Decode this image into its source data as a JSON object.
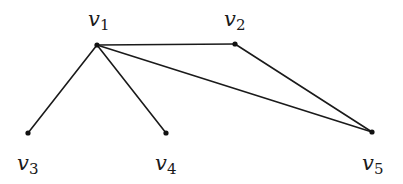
{
  "diagram": {
    "type": "graph",
    "directed": false,
    "colors": {
      "edge": "#1a1a1a",
      "node": "#111111",
      "background": "#ffffff"
    },
    "nodes": [
      {
        "id": "v1",
        "base": "v",
        "sub": "1",
        "x": 97,
        "y": 45,
        "label_x": 88,
        "label_y": 26
      },
      {
        "id": "v2",
        "base": "v",
        "sub": "2",
        "x": 235,
        "y": 44,
        "label_x": 224,
        "label_y": 26
      },
      {
        "id": "v3",
        "base": "v",
        "sub": "3",
        "x": 28,
        "y": 133,
        "label_x": 17,
        "label_y": 170
      },
      {
        "id": "v4",
        "base": "v",
        "sub": "4",
        "x": 166,
        "y": 133,
        "label_x": 155,
        "label_y": 170
      },
      {
        "id": "v5",
        "base": "v",
        "sub": "5",
        "x": 372,
        "y": 132,
        "label_x": 362,
        "label_y": 170
      }
    ],
    "edges": [
      {
        "from": "v1",
        "to": "v2"
      },
      {
        "from": "v1",
        "to": "v3"
      },
      {
        "from": "v1",
        "to": "v4"
      },
      {
        "from": "v1",
        "to": "v5"
      },
      {
        "from": "v2",
        "to": "v5"
      }
    ]
  }
}
